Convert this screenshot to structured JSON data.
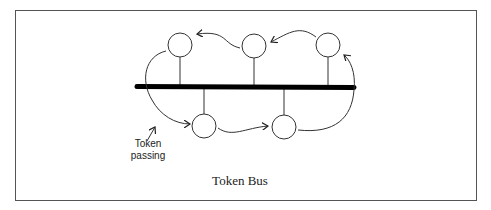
{
  "figure": {
    "caption": "Token Bus",
    "annotation": {
      "line1": "Token",
      "line2": "passing"
    }
  },
  "bus": {
    "label": "bus-line",
    "color": "#000000"
  },
  "nodes": {
    "top": [
      {
        "id": "station-top-1"
      },
      {
        "id": "station-top-2"
      },
      {
        "id": "station-top-3"
      }
    ],
    "bottom": [
      {
        "id": "station-bottom-1"
      },
      {
        "id": "station-bottom-2"
      }
    ]
  },
  "colors": {
    "stroke": "#333333",
    "border": "#555555"
  }
}
